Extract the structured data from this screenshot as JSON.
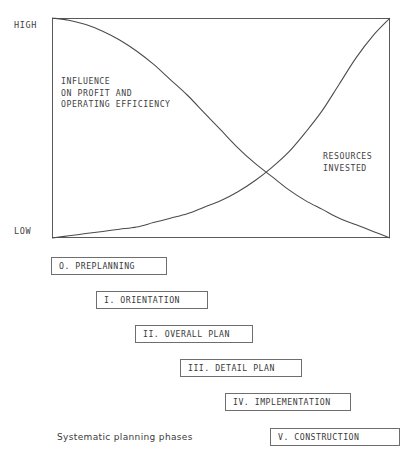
{
  "figure": {
    "caption": "Systematic planning phases"
  },
  "chart_data": {
    "type": "line",
    "title": "",
    "xlabel": "",
    "ylabel": "",
    "ylim": [
      0,
      100
    ],
    "xlim": [
      0,
      100
    ],
    "grid": false,
    "legend_position": "inline-annotation",
    "y_tick_labels": [
      "HIGH",
      "LOW"
    ],
    "y_tick_values": [
      100,
      0
    ],
    "x_tick_labels": [],
    "plot_box": {
      "left": 52,
      "top": 18,
      "right": 390,
      "bottom": 238
    },
    "crossing_point": {
      "x": 66,
      "y": 20
    },
    "series": [
      {
        "name": "INFLUENCE\nON PROFIT AND\nOPERATING EFFICIENCY",
        "label_line1": "INFLUENCE",
        "label_line2": "ON PROFIT AND",
        "label_line3": "OPERATING EFFICIENCY",
        "color": "#4a4a4a",
        "x": [
          0,
          5,
          10,
          15,
          20,
          25,
          30,
          35,
          40,
          45,
          50,
          55,
          60,
          65,
          70,
          75,
          80,
          85,
          90,
          95,
          100
        ],
        "values": [
          100,
          99,
          97,
          94,
          90,
          85,
          79,
          72,
          65,
          57,
          49,
          41,
          34,
          28,
          22,
          17,
          13,
          9,
          6,
          3,
          0
        ]
      },
      {
        "name": "RESOURCES\nINVESTED",
        "label_line1": "RESOURCES",
        "label_line2": "INVESTED",
        "color": "#4a4a4a",
        "x": [
          0,
          5,
          10,
          15,
          20,
          25,
          30,
          35,
          40,
          45,
          50,
          55,
          60,
          65,
          70,
          75,
          80,
          85,
          90,
          95,
          100
        ],
        "values": [
          0,
          1,
          2,
          3,
          4,
          5,
          7,
          9,
          11,
          14,
          17,
          21,
          26,
          32,
          39,
          48,
          58,
          70,
          82,
          92,
          100
        ]
      }
    ]
  },
  "phases": [
    {
      "label": "O. PREPLANNING",
      "left": 51,
      "top": 257,
      "width": 116
    },
    {
      "label": "I. ORIENTATION",
      "left": 96,
      "top": 291,
      "width": 112
    },
    {
      "label": "II. OVERALL PLAN",
      "left": 135,
      "top": 325,
      "width": 118
    },
    {
      "label": "III. DETAIL PLAN",
      "left": 180,
      "top": 359,
      "width": 122
    },
    {
      "label": "IV. IMPLEMENTATION",
      "left": 225,
      "top": 393,
      "width": 126
    },
    {
      "label": "V. CONSTRUCTION",
      "left": 270,
      "top": 428,
      "width": 130
    }
  ]
}
